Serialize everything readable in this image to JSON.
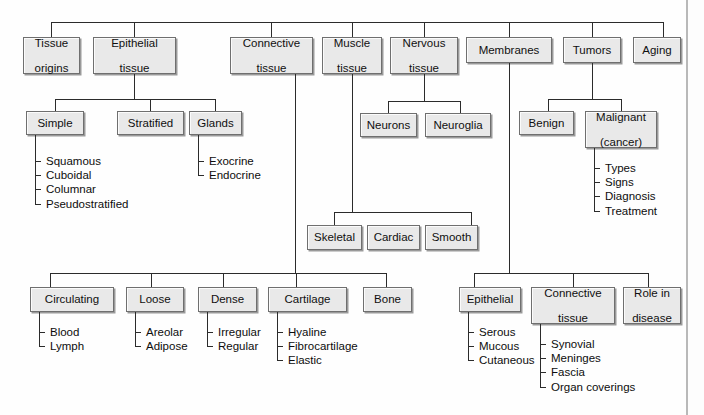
{
  "diagram": {
    "root_children": [
      "Tissue origins",
      "Epithelial tissue",
      "Connective tissue",
      "Muscle tissue",
      "Nervous tissue",
      "Membranes",
      "Tumors",
      "Aging"
    ],
    "nodes": {
      "tissue_origins": "Tissue origins",
      "epithelial_tissue": "Epithelial tissue",
      "connective_tissue": "Connective tissue",
      "muscle_tissue": "Muscle tissue",
      "nervous_tissue": "Nervous tissue",
      "membranes": "Membranes",
      "tumors": "Tumors",
      "aging": "Aging",
      "simple": "Simple",
      "stratified": "Stratified",
      "glands": "Glands",
      "neurons": "Neurons",
      "neuroglia": "Neuroglia",
      "benign": "Benign",
      "malignant": "Malignant (cancer)",
      "skeletal": "Skeletal",
      "cardiac": "Cardiac",
      "smooth": "Smooth",
      "circulating": "Circulating",
      "loose": "Loose",
      "dense": "Dense",
      "cartilage": "Cartilage",
      "bone": "Bone",
      "mem_epithelial": "Epithelial",
      "mem_connective": "Connective tissue",
      "role_in_disease": "Role in disease"
    },
    "node_lines": {
      "tissue_origins": [
        "Tissue",
        "origins"
      ],
      "epithelial_tissue": [
        "Epithelial",
        "tissue"
      ],
      "connective_tissue": [
        "Connective",
        "tissue"
      ],
      "muscle_tissue": [
        "Muscle",
        "tissue"
      ],
      "nervous_tissue": [
        "Nervous",
        "tissue"
      ],
      "membranes": [
        "Membranes"
      ],
      "tumors": [
        "Tumors"
      ],
      "aging": [
        "Aging"
      ],
      "simple": [
        "Simple"
      ],
      "stratified": [
        "Stratified"
      ],
      "glands": [
        "Glands"
      ],
      "neurons": [
        "Neurons"
      ],
      "neuroglia": [
        "Neuroglia"
      ],
      "benign": [
        "Benign"
      ],
      "malignant": [
        "Malignant",
        "(cancer)"
      ],
      "skeletal": [
        "Skeletal"
      ],
      "cardiac": [
        "Cardiac"
      ],
      "smooth": [
        "Smooth"
      ],
      "circulating": [
        "Circulating"
      ],
      "loose": [
        "Loose"
      ],
      "dense": [
        "Dense"
      ],
      "cartilage": [
        "Cartilage"
      ],
      "bone": [
        "Bone"
      ],
      "mem_epithelial": [
        "Epithelial"
      ],
      "mem_connective": [
        "Connective",
        "tissue"
      ],
      "role_in_disease": [
        "Role in",
        "disease"
      ]
    },
    "leaf_lists": {
      "simple_leaves": [
        "Squamous",
        "Cuboidal",
        "Columnar",
        "Pseudostratified"
      ],
      "glands_leaves": [
        "Exocrine",
        "Endocrine"
      ],
      "malignant_leaves": [
        "Types",
        "Signs",
        "Diagnosis",
        "Treatment"
      ],
      "circulating_leaves": [
        "Blood",
        "Lymph"
      ],
      "loose_leaves": [
        "Areolar",
        "Adipose"
      ],
      "dense_leaves": [
        "Irregular",
        "Regular"
      ],
      "cartilage_leaves": [
        "Hyaline",
        "Fibrocartilage",
        "Elastic"
      ],
      "mem_epithelial_leaves": [
        "Serous",
        "Mucous",
        "Cutaneous"
      ],
      "mem_connective_leaves": [
        "Synovial",
        "Meninges",
        "Fascia",
        "Organ coverings"
      ]
    },
    "colors": {
      "box_fill": "#e9e9e9",
      "box_border": "#6f6f6f",
      "box_shadow": "#9a9a9a",
      "line": "#2b2b2b",
      "text": "#101010",
      "background": "#ffffff"
    }
  }
}
